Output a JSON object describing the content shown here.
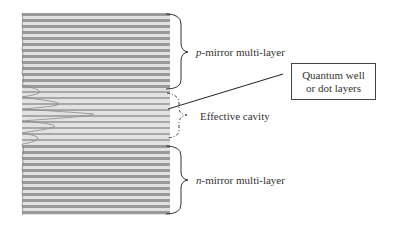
{
  "diagram": {
    "type": "VCSEL layer structure",
    "colors": {
      "dark_layer": "#9a9a9a",
      "light_layer": "#e2e2e2",
      "brace": "#333333",
      "text": "#333333"
    },
    "stack": {
      "x_left": 22,
      "x_right": 170,
      "y_top": 13,
      "y_bottom": 215,
      "period_px": 6
    },
    "regions": [
      {
        "id": "p-mirror",
        "y_start": 13,
        "y_end": 88
      },
      {
        "id": "cavity",
        "y_start": 88,
        "y_end": 140
      },
      {
        "id": "n-mirror",
        "y_start": 140,
        "y_end": 215
      }
    ]
  },
  "labels": {
    "p_mirror_prefix": "p",
    "p_mirror_rest": "-mirror multi-layer",
    "effective_cavity": "Effective cavity",
    "n_mirror_prefix": "n",
    "n_mirror_rest": "-mirror multi-layer",
    "quantum_line1": "Quantum well",
    "quantum_line2": "or dot layers"
  }
}
